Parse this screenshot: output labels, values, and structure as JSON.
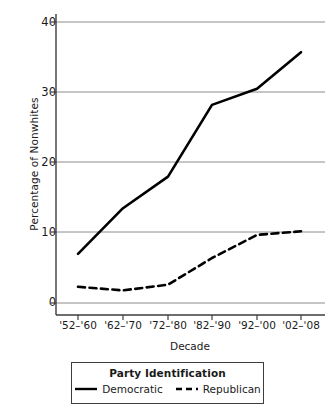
{
  "chart_data": {
    "type": "line",
    "title": "",
    "xlabel": "Decade",
    "ylabel": "Percentage of Nonwhites",
    "categories": [
      "'52–'60",
      "'62–'70",
      "'72–'80",
      "'82–'90",
      "'92–'00",
      "'02–'08"
    ],
    "yticks": [
      0,
      10,
      20,
      30,
      40
    ],
    "ytick_labels": [
      "0",
      "10",
      "20",
      "30",
      "40"
    ],
    "ylim": [
      0,
      42
    ],
    "grid": "horizontal",
    "legend_position": "below-axes",
    "legend_title": "Party Identification",
    "series": [
      {
        "name": "Democratic",
        "style": "solid",
        "color": "#000000",
        "values": [
          7.0,
          13.5,
          18.0,
          28.2,
          30.5,
          35.7
        ]
      },
      {
        "name": "Republican",
        "style": "dashed",
        "color": "#000000",
        "values": [
          2.3,
          1.8,
          2.6,
          6.4,
          9.7,
          10.2
        ]
      }
    ]
  },
  "axes": {
    "ylabel": "Percentage of Nonwhites",
    "xlabel": "Decade",
    "ytick_labels": [
      "40",
      "30",
      "20",
      "10",
      "0"
    ],
    "xtick_labels": [
      "'52–'60",
      "'62–'70",
      "'72–'80",
      "'82–'90",
      "'92–'00",
      "'02–'08"
    ]
  },
  "legend": {
    "title": "Party Identification",
    "entries": [
      {
        "label": "Democratic",
        "style": "solid"
      },
      {
        "label": "Republican",
        "style": "dashed"
      }
    ]
  },
  "colors": {
    "line": "#000000",
    "grid": "#8c8c8c",
    "axis": "#3d3d3d",
    "text": "#1a1a1a",
    "background": "#ffffff"
  }
}
